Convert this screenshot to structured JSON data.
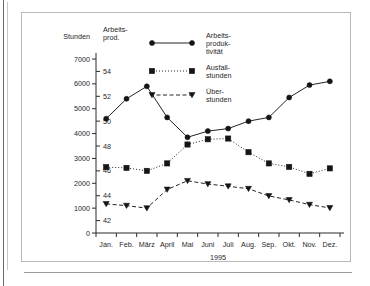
{
  "page": {
    "left_rule": "page-edge-rule",
    "bottom_rule": "page-bottom-rule"
  },
  "axes": {
    "left_axis_title": "Stunden",
    "right_axis_title_line1": "Arbeits-",
    "right_axis_title_line2": "prod.",
    "xlabel": "1995"
  },
  "legend": [
    {
      "label_line1": "Arbeits-",
      "label_line2": "produk-",
      "label_line3": "tivität",
      "marker": "circle",
      "line": "solid"
    },
    {
      "label_line1": "Ausfall-",
      "label_line2": "stunden",
      "label_line3": "",
      "marker": "square",
      "line": "dotted"
    },
    {
      "label_line1": "Über-",
      "label_line2": "stunden",
      "label_line3": "",
      "marker": "triangle-down",
      "line": "dashed"
    }
  ],
  "chart_data": {
    "type": "line",
    "title": "",
    "xlabel": "1995",
    "ylabel": "Stunden",
    "y2label": "Arbeits-prod.",
    "grid": false,
    "legend_position": "top-right",
    "categories": [
      "Jan.",
      "Feb.",
      "März",
      "April",
      "Mai",
      "Juni",
      "Juli",
      "Aug.",
      "Sep.",
      "Okt.",
      "Nov.",
      "Dez."
    ],
    "ylim": [
      0,
      7000
    ],
    "yticks": [
      0,
      1000,
      2000,
      3000,
      4000,
      5000,
      6000,
      7000
    ],
    "ytick_labels": [
      "0",
      "1000",
      "2000",
      "3000",
      "4000",
      "5000",
      "6000",
      "7000"
    ],
    "y2lim": [
      41,
      55
    ],
    "y2ticks": [
      42,
      44,
      46,
      48,
      50,
      52,
      54
    ],
    "y2tick_labels": [
      "42",
      "44",
      "46",
      "48",
      "50",
      "52",
      "54"
    ],
    "series": [
      {
        "name": "Arbeitsproduktivität",
        "axis": "right",
        "marker": "circle",
        "linestyle": "solid",
        "values": [
          50.2,
          51.8,
          52.8,
          50.3,
          48.7,
          49.2,
          49.4,
          50.0,
          50.3,
          51.9,
          52.9,
          53.2
        ]
      },
      {
        "name": "Ausfallstunden",
        "axis": "left",
        "marker": "square",
        "linestyle": "dotted",
        "values": [
          2650,
          2620,
          2500,
          2800,
          3560,
          3770,
          3800,
          3250,
          2800,
          2660,
          2380,
          2600
        ]
      },
      {
        "name": "Überstunden",
        "axis": "left",
        "marker": "triangle-down",
        "linestyle": "dashed",
        "values": [
          1170,
          1100,
          1000,
          1750,
          2100,
          1970,
          1880,
          1780,
          1490,
          1330,
          1140,
          1010
        ]
      }
    ]
  },
  "colors": {
    "ink": "#242424",
    "frame": "#b9b9b9",
    "background": "#ffffff"
  }
}
